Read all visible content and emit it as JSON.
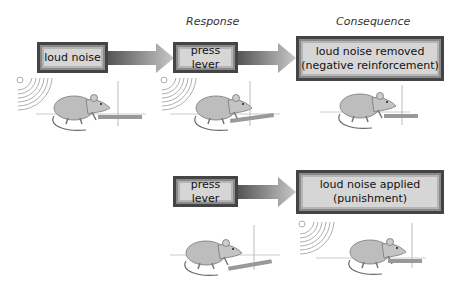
{
  "headers": {
    "response": "Response",
    "consequence": "Consequence"
  },
  "top_row": {
    "stimulus": "loud noise",
    "response": "press lever",
    "consequence_line1": "loud noise removed",
    "consequence_line2": "(negative reinforcement)"
  },
  "bottom_row": {
    "response": "press lever",
    "consequence_line1": "loud noise applied",
    "consequence_line2": "(punishment)"
  }
}
